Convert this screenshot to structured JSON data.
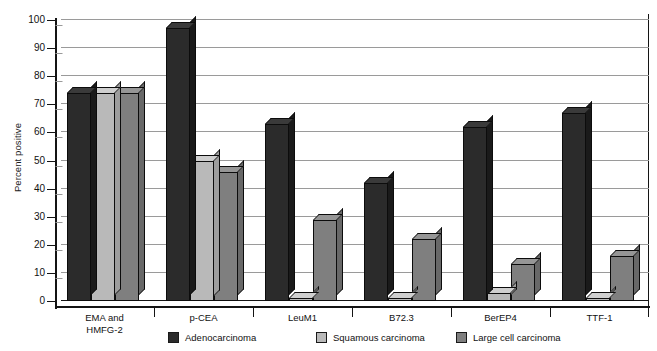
{
  "chart_data": {
    "type": "bar",
    "title": "",
    "subtitle": "",
    "xlabel": "",
    "ylabel": "Percent positive",
    "ylim": [
      0,
      100
    ],
    "ytick_step": 10,
    "yticks": [
      "0",
      "10",
      "20",
      "30",
      "40",
      "50",
      "60",
      "70",
      "80",
      "90",
      "100"
    ],
    "grid": true,
    "grid_axis": "y",
    "legend_position": "bottom",
    "style": "3d-column",
    "categories": [
      "EMA and\nHMFG-2",
      "p-CEA",
      "LeuM1",
      "B72.3",
      "BerEP4",
      "TTF-1"
    ],
    "category_labels": [
      [
        "EMA and",
        "HMFG-2"
      ],
      [
        "p-CEA",
        ""
      ],
      [
        "LeuM1",
        ""
      ],
      [
        "B72.3",
        ""
      ],
      [
        "BerEP4",
        ""
      ],
      [
        "TTF-1",
        ""
      ]
    ],
    "series": [
      {
        "name": "Adenocarcinoma",
        "color": "#2b2b2b",
        "top_color": "#3a3a3a",
        "side_color": "#1a1a1a",
        "values": [
          74,
          97,
          63,
          42,
          62,
          67
        ]
      },
      {
        "name": "Squamous carcinoma",
        "color": "#b9b9b9",
        "top_color": "#cfcfcf",
        "side_color": "#9d9d9d",
        "values": [
          74,
          50,
          1,
          1,
          3,
          1
        ]
      },
      {
        "name": "Large cell carcinoma",
        "color": "#7f7f7f",
        "top_color": "#969696",
        "side_color": "#686868",
        "values": [
          74,
          46,
          29,
          22,
          13,
          16
        ]
      }
    ]
  },
  "legend": {
    "items": [
      {
        "label": "Adenocarcinoma",
        "color": "#2b2b2b"
      },
      {
        "label": "Squamous carcinoma",
        "color": "#b9b9b9"
      },
      {
        "label": "Large cell carcinoma",
        "color": "#7f7f7f"
      }
    ]
  },
  "axes": {
    "y_title": "Percent positive"
  }
}
